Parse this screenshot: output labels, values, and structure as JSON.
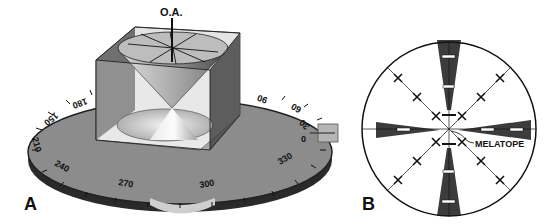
{
  "figure": {
    "panels": [
      {
        "id": "A",
        "label": "A",
        "optic_axis_label": "O.A.",
        "stage_ticks": [
          "180",
          "150",
          "90",
          "60",
          "30",
          "0",
          "330",
          "300",
          "270",
          "240",
          "210"
        ]
      },
      {
        "id": "B",
        "label": "B",
        "annotation": "MELATOPE"
      }
    ]
  },
  "colors": {
    "stage_top": "#8a8a8a",
    "stage_edge": "#3a3a3a",
    "isogyre": "#3c3c3c",
    "outline": "#111111",
    "background": "#ffffff"
  }
}
